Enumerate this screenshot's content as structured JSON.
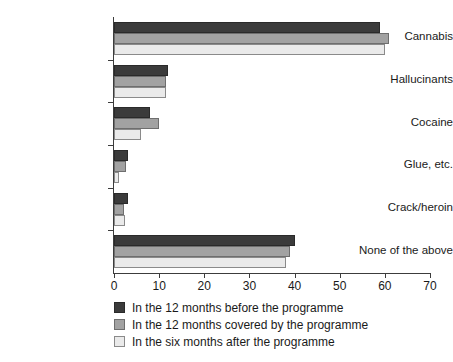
{
  "chart_data": {
    "type": "bar",
    "orientation": "horizontal",
    "title": "",
    "xlabel": "",
    "ylabel": "",
    "xlim": [
      0,
      70
    ],
    "xticks": [
      0,
      10,
      20,
      30,
      40,
      50,
      60,
      70
    ],
    "grid": false,
    "legend_position": "bottom-left",
    "categories": [
      "Cannabis",
      "Hallucinants",
      "Cocaine",
      "Glue, etc.",
      "Crack/heroin",
      "None of the above"
    ],
    "series": [
      {
        "name": "In the 12 months before the programme",
        "color": "#3b3b3b",
        "values": [
          59,
          12,
          8,
          3,
          3,
          40
        ]
      },
      {
        "name": "In the 12 months covered by the programme",
        "color": "#a2a2a2",
        "values": [
          61,
          11.5,
          10,
          2.7,
          2.3,
          39
        ]
      },
      {
        "name": "In the six months after the programme",
        "color": "#eaeaea",
        "values": [
          60,
          11.5,
          6,
          1,
          2.5,
          38
        ]
      }
    ]
  },
  "legend": {
    "items": [
      "In the 12 months before the programme",
      "In the 12 months covered by the programme",
      "In the six months after the programme"
    ]
  }
}
